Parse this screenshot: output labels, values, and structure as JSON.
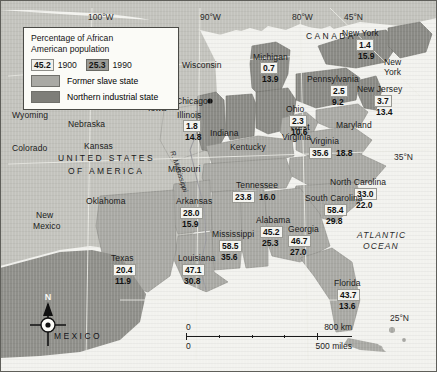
{
  "map": {
    "title": "Percentage of African American population",
    "legend": {
      "title_line1": "Percentage of African",
      "title_line2": "American population",
      "key_1900_value": "45.2",
      "key_1900_year": "1900",
      "key_1990_value": "25.3",
      "key_1990_year": "1990",
      "swatch_slave_label": "Former slave state",
      "swatch_north_label": "Northern industrial state",
      "color_slave": "#a9a9a4",
      "color_north": "#7e7e79"
    },
    "countries": [
      {
        "name": "CANADA",
        "x": 316,
        "y": 36
      },
      {
        "name": "UNITED STATES",
        "x": 120,
        "y": 156
      },
      {
        "name": "OF AMERICA",
        "x": 122,
        "y": 168
      },
      {
        "name": "MEXICO",
        "x": 76,
        "y": 334
      }
    ],
    "ocean_label_line1": "ATLANTIC",
    "ocean_label_line2": "OCEAN",
    "river_label": "R. Mississippi",
    "city": {
      "name": "Chicago",
      "x": 178,
      "y": 102
    },
    "coordinates": [
      {
        "label": "100°W",
        "x": 97,
        "y": 17
      },
      {
        "label": "90°W",
        "x": 208,
        "y": 17
      },
      {
        "label": "80°W",
        "x": 300,
        "y": 17
      },
      {
        "label": "45°N",
        "x": 351,
        "y": 17
      },
      {
        "label": "35°N",
        "x": 398,
        "y": 157
      },
      {
        "label": "25°N",
        "x": 393,
        "y": 318
      }
    ],
    "states_plain": [
      {
        "name": "Wyoming",
        "x": 12,
        "y": 114
      },
      {
        "name": "Nebraska",
        "x": 68,
        "y": 123
      },
      {
        "name": "Iowa",
        "x": 148,
        "y": 107
      },
      {
        "name": "Colorado",
        "x": 12,
        "y": 145
      },
      {
        "name": "Kansas",
        "x": 83,
        "y": 145
      },
      {
        "name": "Missouri",
        "x": 170,
        "y": 166
      },
      {
        "name": "Minnesota",
        "x": 168,
        "y": 28
      },
      {
        "name": "Wisconsin",
        "x": 182,
        "y": 63
      },
      {
        "name": "Oklahoma",
        "x": 88,
        "y": 199
      },
      {
        "name": "New",
        "x": 38,
        "y": 213
      },
      {
        "name": "Mexico",
        "x": 35,
        "y": 224
      },
      {
        "name": "Kentucky",
        "x": 232,
        "y": 145
      },
      {
        "name": "Indiana",
        "x": 212,
        "y": 131
      },
      {
        "name": "West",
        "x": 290,
        "y": 126
      },
      {
        "name": "Virginia",
        "x": 285,
        "y": 136
      },
      {
        "name": "New",
        "x": 383,
        "y": 60
      },
      {
        "name": "York",
        "x": 383,
        "y": 70
      },
      {
        "name": "New Jersey",
        "x": 0,
        "y": 0
      }
    ],
    "state_values": [
      {
        "name": "Michigan",
        "label_x": 254,
        "label_y": 55,
        "box_x": 261,
        "box_y": 66,
        "v1": "0.7",
        "v2": "13.9"
      },
      {
        "name": "Illinois",
        "label_x": 178,
        "label_y": 113,
        "box_x": 184,
        "box_y": 124,
        "v1": "1.8",
        "v2": "14.8"
      },
      {
        "name": "Ohio",
        "label_x": 287,
        "label_y": 108,
        "box_x": 290,
        "box_y": 119,
        "v1": "2.3",
        "v2": "10.6"
      },
      {
        "name": "Pennsylvania",
        "label_x": 320,
        "label_y": 77,
        "box_x": 333,
        "box_y": 88,
        "v1": "2.5",
        "v2": "9.2"
      },
      {
        "name": "New York",
        "label_x": 347,
        "label_y": 31,
        "box_x": 358,
        "box_y": 42,
        "v1": "1.4",
        "v2": "15.9"
      },
      {
        "name": "New Jersey",
        "label_x": 367,
        "label_y": 87,
        "box_x": 376,
        "box_y": 98,
        "v1": "3.7",
        "v2": "13.4"
      },
      {
        "name": "Maryland",
        "label_x": 342,
        "label_y": 123,
        "box_x": 0,
        "box_y": 0,
        "v1": "",
        "v2": ""
      },
      {
        "name": "Virginia",
        "label_x": 314,
        "label_y": 140,
        "box_x": 313,
        "box_y": 150,
        "v1": "35.6",
        "v2": "18.8"
      },
      {
        "name": "North Carolina",
        "label_x": 334,
        "label_y": 180,
        "box_x": 357,
        "box_y": 190,
        "v1": "33.0",
        "v2": "22.0"
      },
      {
        "name": "South Carolina",
        "label_x": 311,
        "label_y": 196,
        "box_x": 327,
        "box_y": 206,
        "v1": "58.4",
        "v2": "29.8"
      },
      {
        "name": "Georgia",
        "label_x": 291,
        "label_y": 227,
        "box_x": 290,
        "box_y": 237,
        "v1": "46.7",
        "v2": "27.0"
      },
      {
        "name": "Florida",
        "label_x": 337,
        "label_y": 281,
        "box_x": 340,
        "box_y": 291,
        "v1": "43.7",
        "v2": "13.6"
      },
      {
        "name": "Tennessee",
        "label_x": 239,
        "label_y": 183,
        "box_x": 235,
        "box_y": 193,
        "v1": "23.8",
        "v2": "16.0"
      },
      {
        "name": "Alabama",
        "label_x": 258,
        "label_y": 218,
        "box_x": 262,
        "box_y": 228,
        "v1": "45.2",
        "v2": "25.3"
      },
      {
        "name": "Mississippi",
        "label_x": 215,
        "label_y": 232,
        "box_x": 221,
        "box_y": 242,
        "v1": "58.5",
        "v2": "35.6"
      },
      {
        "name": "Arkansas",
        "label_x": 178,
        "label_y": 199,
        "box_x": 182,
        "box_y": 209,
        "v1": "28.0",
        "v2": "15.9"
      },
      {
        "name": "Louisiana",
        "label_x": 180,
        "label_y": 256,
        "box_x": 184,
        "box_y": 266,
        "v1": "47.1",
        "v2": "30.8"
      },
      {
        "name": "Texas",
        "label_x": 113,
        "label_y": 256,
        "box_x": 115,
        "box_y": 266,
        "v1": "20.4",
        "v2": "11.9"
      }
    ],
    "scale": {
      "km_start": "0",
      "km_end": "800 km",
      "miles_start": "0",
      "miles_end": "500 miles"
    },
    "compass_north": "N"
  }
}
